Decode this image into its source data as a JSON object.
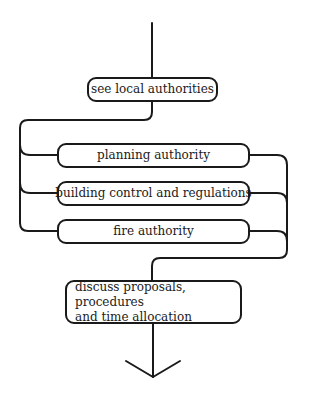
{
  "diagram": {
    "type": "flowchart",
    "nodes": [
      {
        "id": "n1",
        "label": "see local authorities"
      },
      {
        "id": "n2",
        "label": "planning authority"
      },
      {
        "id": "n3",
        "label": "building control and regulations"
      },
      {
        "id": "n4",
        "label": "fire authority"
      },
      {
        "id": "n5",
        "label_line1": "discuss proposals, procedures",
        "label_line2": "and time allocation"
      }
    ],
    "edges": [
      {
        "from": "start",
        "to": "n1"
      },
      {
        "from": "n1",
        "to": "n2"
      },
      {
        "from": "n1",
        "to": "n3"
      },
      {
        "from": "n1",
        "to": "n4"
      },
      {
        "from": "n2",
        "to": "n5"
      },
      {
        "from": "n3",
        "to": "n5"
      },
      {
        "from": "n4",
        "to": "n5"
      },
      {
        "from": "n5",
        "to": "end-arrow"
      }
    ],
    "colors": {
      "stroke": "#1a1a1a",
      "background": "#ffffff"
    }
  }
}
